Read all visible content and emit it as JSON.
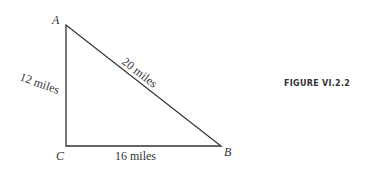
{
  "figure": {
    "caption": "FIGURE VI.2.2",
    "vertices": {
      "A": {
        "label": "A"
      },
      "B": {
        "label": "B"
      },
      "C": {
        "label": "C"
      }
    },
    "sides": {
      "AC": {
        "label": "12 miles"
      },
      "AB": {
        "label": "20 miles"
      },
      "CB": {
        "label": "16 miles"
      }
    },
    "line_color": "#333333"
  }
}
